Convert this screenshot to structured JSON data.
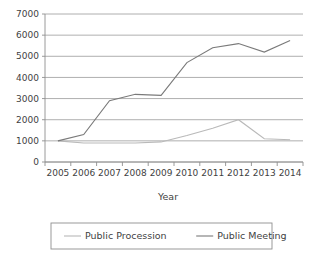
{
  "chart_data": {
    "type": "line",
    "title": "",
    "xlabel": "Year",
    "ylabel": "",
    "categories": [
      "2005",
      "2006",
      "2007",
      "2008",
      "2009",
      "2010",
      "2011",
      "2012",
      "2013",
      "2014"
    ],
    "x": [
      2005,
      2006,
      2007,
      2008,
      2009,
      2010,
      2011,
      2012,
      2013,
      2014
    ],
    "series": [
      {
        "name": "Public Procession",
        "color": "#b9b9b9",
        "values": [
          1000,
          900,
          900,
          900,
          950,
          1250,
          1600,
          2000,
          1100,
          1050
        ]
      },
      {
        "name": "Public Meeting",
        "color": "#7a7a7a",
        "values": [
          1000,
          1300,
          2900,
          3200,
          3150,
          4700,
          5400,
          5600,
          5200,
          5750
        ]
      }
    ],
    "ylim": [
      0,
      7000
    ],
    "yticks": [
      0,
      1000,
      2000,
      3000,
      4000,
      5000,
      6000,
      7000
    ],
    "ytick_labels": [
      "0",
      "1000",
      "2000",
      "3000",
      "4000",
      "5000",
      "6000",
      "7000"
    ],
    "grid": true,
    "legend_position": "bottom"
  },
  "axis": {
    "x_title": "Year"
  },
  "legend": {
    "entries": [
      {
        "label": "Public Procession"
      },
      {
        "label": "Public Meeting"
      }
    ]
  }
}
